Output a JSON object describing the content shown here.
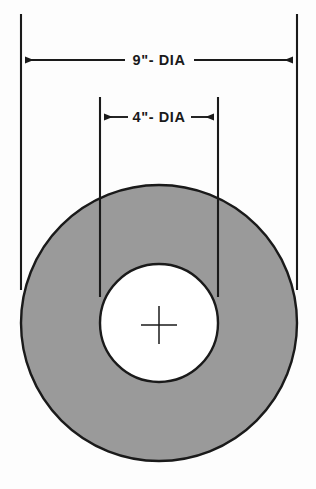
{
  "drawing": {
    "title": "Annulus cross-section with diameter dimensions",
    "background_color": "#fdfdfd",
    "line_color": "#1a1a1a",
    "fill_color": "#9a9a9a",
    "hole_fill_color": "#ffffff"
  },
  "dimensions": {
    "outer": {
      "label": "9\"- DIA",
      "value": 9,
      "unit": "inch",
      "type": "diameter",
      "extension_left_x": 21,
      "extension_right_x": 297,
      "extension_top_y": 14,
      "extension_bottom_y": 290,
      "dim_line_y": 60
    },
    "inner": {
      "label": "4\"- DIA",
      "value": 4,
      "unit": "inch",
      "type": "diameter",
      "extension_left_x": 100,
      "extension_right_x": 218,
      "extension_top_y": 97,
      "extension_bottom_y": 297,
      "dim_line_y": 117
    }
  },
  "shapes": {
    "outer_circle": {
      "name": "outer-circle",
      "cx": 159,
      "cy": 323,
      "r": 138,
      "fill": "#9a9a9a",
      "stroke": "#1a1a1a",
      "stroke_width": 2.4
    },
    "inner_circle": {
      "name": "inner-hole-circle",
      "cx": 159,
      "cy": 323,
      "r": 59,
      "fill": "#ffffff",
      "stroke": "#1a1a1a",
      "stroke_width": 2.4
    },
    "center_mark": {
      "name": "center-cross-mark",
      "cx": 159,
      "cy": 325,
      "half_width": 18,
      "half_height": 19,
      "stroke": "#1a1a1a",
      "stroke_width": 1.5
    }
  }
}
